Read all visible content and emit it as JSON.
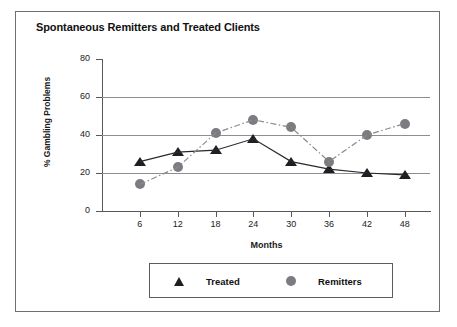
{
  "figure": {
    "title": "Spontaneous Remitters and Treated Clients",
    "border_color": "#6e6e73",
    "background": "#ffffff"
  },
  "chart_data": {
    "type": "line",
    "title": "Spontaneous Remitters and Treated Clients",
    "xlabel": "Months",
    "ylabel": "% Gambling Problems",
    "categories": [
      "6",
      "12",
      "18",
      "24",
      "30",
      "36",
      "42",
      "48"
    ],
    "x": [
      6,
      12,
      18,
      24,
      30,
      36,
      42,
      48
    ],
    "xlim": [
      0,
      52
    ],
    "ylim": [
      0,
      80
    ],
    "yticks": [
      0,
      20,
      40,
      60,
      80
    ],
    "xticks": [
      6,
      12,
      18,
      24,
      30,
      36,
      42,
      48
    ],
    "grid": "horizontal",
    "legend_position": "bottom",
    "series": [
      {
        "name": "Treated",
        "marker": "triangle",
        "color": "#1f1f23",
        "line_style": "solid",
        "values": [
          26,
          31,
          32,
          38,
          26,
          22,
          20,
          19
        ]
      },
      {
        "name": "Remitters",
        "marker": "circle",
        "color": "#7c7c80",
        "line_style": "dash-dot",
        "values": [
          14,
          23,
          41,
          48,
          44,
          26,
          40,
          46
        ]
      }
    ]
  },
  "legend": {
    "items": [
      {
        "label": "Treated",
        "marker": "triangle-marker-icon"
      },
      {
        "label": "Remitters",
        "marker": "circle-marker-icon"
      }
    ]
  },
  "axes": {
    "y_tick_labels": [
      "80",
      "60",
      "40",
      "20",
      "0"
    ],
    "x_tick_labels": [
      "6",
      "12",
      "18",
      "24",
      "30",
      "36",
      "42",
      "48"
    ]
  }
}
